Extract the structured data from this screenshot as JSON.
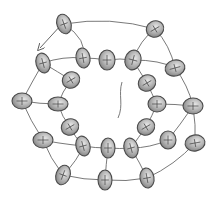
{
  "diagram": {
    "type": "bead-weaving-pattern",
    "colors": {
      "bead_fill": "#a8a8a8",
      "bead_highlight": "#e4e4e4",
      "bead_stroke": "#4a4a4a",
      "thread": "#6a6a6a",
      "background": "#ffffff"
    },
    "arrow": {
      "from": [
        62,
        24
      ],
      "to": [
        40,
        48
      ]
    },
    "tail": {
      "points": [
        [
          122,
          82
        ],
        [
          118,
          95
        ],
        [
          124,
          105
        ],
        [
          118,
          118
        ]
      ]
    },
    "beads": [
      {
        "id": 1,
        "x": 64,
        "y": 24,
        "rx": 7,
        "ry": 10,
        "rot": -20
      },
      {
        "id": 2,
        "x": 155,
        "y": 29,
        "rx": 9,
        "ry": 8,
        "rot": -30
      },
      {
        "id": 3,
        "x": 175,
        "y": 68,
        "rx": 10,
        "ry": 8,
        "rot": -15
      },
      {
        "id": 4,
        "x": 193,
        "y": 106,
        "rx": 10,
        "ry": 8,
        "rot": 0
      },
      {
        "id": 5,
        "x": 195,
        "y": 143,
        "rx": 10,
        "ry": 8,
        "rot": -10
      },
      {
        "id": 6,
        "x": 147,
        "y": 178,
        "rx": 7,
        "ry": 10,
        "rot": -10
      },
      {
        "id": 7,
        "x": 105,
        "y": 180,
        "rx": 7,
        "ry": 10,
        "rot": 0
      },
      {
        "id": 8,
        "x": 63,
        "y": 175,
        "rx": 7,
        "ry": 10,
        "rot": 20
      },
      {
        "id": 9,
        "x": 43,
        "y": 140,
        "rx": 10,
        "ry": 8,
        "rot": 0
      },
      {
        "id": 10,
        "x": 22,
        "y": 101,
        "rx": 10,
        "ry": 8,
        "rot": 0
      },
      {
        "id": 11,
        "x": 43,
        "y": 63,
        "rx": 7,
        "ry": 10,
        "rot": -15
      },
      {
        "id": 12,
        "x": 83,
        "y": 58,
        "rx": 7,
        "ry": 10,
        "rot": -10
      },
      {
        "id": 13,
        "x": 107,
        "y": 60,
        "rx": 8,
        "ry": 10,
        "rot": 0
      },
      {
        "id": 14,
        "x": 133,
        "y": 60,
        "rx": 8,
        "ry": 10,
        "rot": 15
      },
      {
        "id": 15,
        "x": 71,
        "y": 80,
        "rx": 9,
        "ry": 8,
        "rot": -30
      },
      {
        "id": 16,
        "x": 147,
        "y": 83,
        "rx": 9,
        "ry": 8,
        "rot": -30
      },
      {
        "id": 17,
        "x": 58,
        "y": 104,
        "rx": 10,
        "ry": 7,
        "rot": 0
      },
      {
        "id": 18,
        "x": 157,
        "y": 104,
        "rx": 9,
        "ry": 8,
        "rot": 0
      },
      {
        "id": 19,
        "x": 70,
        "y": 127,
        "rx": 9,
        "ry": 8,
        "rot": -30
      },
      {
        "id": 20,
        "x": 146,
        "y": 127,
        "rx": 9,
        "ry": 8,
        "rot": -30
      },
      {
        "id": 21,
        "x": 83,
        "y": 146,
        "rx": 7,
        "ry": 10,
        "rot": -15
      },
      {
        "id": 22,
        "x": 108,
        "y": 148,
        "rx": 7,
        "ry": 10,
        "rot": 0
      },
      {
        "id": 23,
        "x": 131,
        "y": 148,
        "rx": 7,
        "ry": 10,
        "rot": -15
      },
      {
        "id": 24,
        "x": 168,
        "y": 140,
        "rx": 8,
        "ry": 9,
        "rot": 0
      }
    ],
    "threads": [
      [
        [
          64,
          24
        ],
        [
          110,
          16
        ],
        [
          155,
          29
        ]
      ],
      [
        [
          155,
          29
        ],
        [
          170,
          45
        ],
        [
          175,
          68
        ]
      ],
      [
        [
          175,
          68
        ],
        [
          188,
          85
        ],
        [
          193,
          106
        ]
      ],
      [
        [
          193,
          106
        ],
        [
          196,
          125
        ],
        [
          195,
          143
        ]
      ],
      [
        [
          195,
          143
        ],
        [
          175,
          165
        ],
        [
          147,
          178
        ]
      ],
      [
        [
          147,
          178
        ],
        [
          126,
          182
        ],
        [
          105,
          180
        ]
      ],
      [
        [
          105,
          180
        ],
        [
          84,
          180
        ],
        [
          63,
          175
        ]
      ],
      [
        [
          63,
          175
        ],
        [
          50,
          158
        ],
        [
          43,
          140
        ]
      ],
      [
        [
          43,
          140
        ],
        [
          30,
          120
        ],
        [
          22,
          101
        ]
      ],
      [
        [
          22,
          101
        ],
        [
          32,
          82
        ],
        [
          43,
          63
        ]
      ],
      [
        [
          43,
          63
        ],
        [
          63,
          56
        ],
        [
          83,
          58
        ]
      ],
      [
        [
          83,
          58
        ],
        [
          95,
          58
        ],
        [
          107,
          60
        ]
      ],
      [
        [
          107,
          60
        ],
        [
          120,
          58
        ],
        [
          133,
          60
        ]
      ],
      [
        [
          133,
          60
        ],
        [
          160,
          60
        ],
        [
          175,
          68
        ]
      ],
      [
        [
          43,
          63
        ],
        [
          58,
          72
        ],
        [
          71,
          80
        ]
      ],
      [
        [
          71,
          80
        ],
        [
          62,
          92
        ],
        [
          58,
          104
        ]
      ],
      [
        [
          58,
          104
        ],
        [
          62,
          117
        ],
        [
          70,
          127
        ]
      ],
      [
        [
          70,
          127
        ],
        [
          75,
          137
        ],
        [
          83,
          146
        ]
      ],
      [
        [
          83,
          146
        ],
        [
          95,
          148
        ],
        [
          108,
          148
        ]
      ],
      [
        [
          108,
          148
        ],
        [
          120,
          149
        ],
        [
          131,
          148
        ]
      ],
      [
        [
          131,
          148
        ],
        [
          150,
          148
        ],
        [
          168,
          140
        ]
      ],
      [
        [
          133,
          60
        ],
        [
          140,
          72
        ],
        [
          147,
          83
        ]
      ],
      [
        [
          147,
          83
        ],
        [
          152,
          94
        ],
        [
          157,
          104
        ]
      ],
      [
        [
          157,
          104
        ],
        [
          152,
          116
        ],
        [
          146,
          127
        ]
      ],
      [
        [
          146,
          127
        ],
        [
          138,
          138
        ],
        [
          131,
          148
        ]
      ],
      [
        [
          168,
          140
        ],
        [
          180,
          125
        ],
        [
          193,
          106
        ]
      ],
      [
        [
          58,
          104
        ],
        [
          40,
          104
        ],
        [
          22,
          101
        ]
      ],
      [
        [
          43,
          140
        ],
        [
          55,
          143
        ],
        [
          83,
          146
        ]
      ],
      [
        [
          83,
          146
        ],
        [
          78,
          160
        ],
        [
          63,
          175
        ]
      ],
      [
        [
          108,
          148
        ],
        [
          106,
          165
        ],
        [
          105,
          180
        ]
      ],
      [
        [
          131,
          148
        ],
        [
          140,
          163
        ],
        [
          147,
          178
        ]
      ],
      [
        [
          83,
          58
        ],
        [
          88,
          40
        ],
        [
          64,
          24
        ]
      ],
      [
        [
          133,
          60
        ],
        [
          140,
          40
        ],
        [
          155,
          29
        ]
      ],
      [
        [
          157,
          104
        ],
        [
          175,
          104
        ],
        [
          193,
          106
        ]
      ]
    ]
  }
}
